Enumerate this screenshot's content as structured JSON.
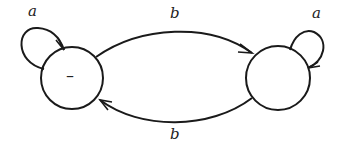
{
  "diagram": {
    "type": "finite-automaton",
    "states": [
      {
        "id": "s0",
        "label": "–",
        "start": true
      },
      {
        "id": "s1",
        "label": ""
      }
    ],
    "transitions": [
      {
        "from": "s0",
        "to": "s0",
        "label": "a"
      },
      {
        "from": "s0",
        "to": "s1",
        "label": "b"
      },
      {
        "from": "s1",
        "to": "s1",
        "label": "a"
      },
      {
        "from": "s1",
        "to": "s0",
        "label": "b"
      }
    ]
  },
  "colors": {
    "stroke": "#1a1a1a",
    "background": "#ffffff"
  }
}
